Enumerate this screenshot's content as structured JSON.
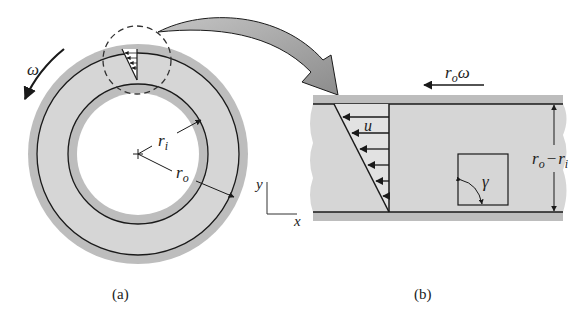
{
  "panel_a": {
    "caption": "(a)",
    "omega_label": "ω",
    "r_inner_label": "r",
    "r_inner_sub": "i",
    "r_outer_label": "r",
    "r_outer_sub": "o",
    "axis_y_label": "y",
    "axis_x_label": "x"
  },
  "panel_b": {
    "caption": "(b)",
    "velocity_label": "r",
    "velocity_sub": "o",
    "velocity_suffix": "ω",
    "u_label": "u",
    "gap_label_r1": "r",
    "gap_label_sub1": "o",
    "gap_label_minus": "−",
    "gap_label_r2": "r",
    "gap_label_sub2": "i",
    "shear_label": "γ"
  },
  "colors": {
    "fluid_grey": "#d6d6d6",
    "wall_grey": "#bdbdbd",
    "line": "#1a1a1a",
    "callout_arrow": "#9a9a9a"
  }
}
